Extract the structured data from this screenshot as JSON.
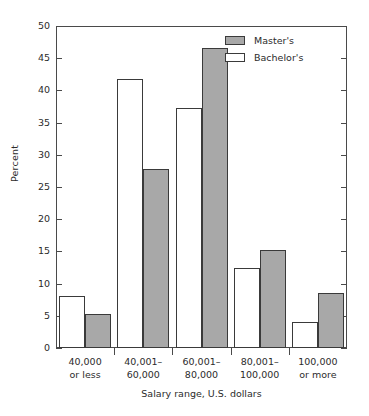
{
  "chart_data": {
    "type": "bar",
    "title": "",
    "xlabel": "Salary range, U.S. dollars",
    "ylabel": "Percent",
    "ylim": [
      0,
      50
    ],
    "ytick_step": 5,
    "yticks": [
      0,
      5,
      10,
      15,
      20,
      25,
      30,
      35,
      40,
      45,
      50
    ],
    "ytick_labels": [
      "0",
      "5",
      "10",
      "15",
      "20",
      "25",
      "30",
      "35",
      "40",
      "45",
      "50"
    ],
    "grid": false,
    "legend_position": "top-right",
    "categories": [
      "40,000 or less",
      "40,001–60,000",
      "60,001–80,000",
      "80,001–100,000",
      "100,000 or more"
    ],
    "category_lines": [
      [
        "40,000",
        "or less"
      ],
      [
        "40,001–",
        "60,000"
      ],
      [
        "60,001–",
        "80,000"
      ],
      [
        "80,001–",
        "100,000"
      ],
      [
        "100,000",
        "or more"
      ]
    ],
    "series": [
      {
        "name": "Bachelor's",
        "fill": "#ffffff",
        "values": [
          8.0,
          41.8,
          37.2,
          12.5,
          4.0
        ]
      },
      {
        "name": "Master's",
        "fill": "#a8a8a8",
        "values": [
          5.3,
          27.8,
          46.6,
          15.2,
          8.6
        ]
      }
    ]
  },
  "legend": {
    "items": [
      {
        "label": "Master's",
        "swatch": "masters"
      },
      {
        "label": "Bachelor's",
        "swatch": "bachelors"
      }
    ]
  },
  "colors": {
    "masters_fill": "#a8a8a8",
    "bachelors_fill": "#ffffff",
    "bar_outline": "#3a3a3a",
    "axis": "#4a4a4a",
    "text": "#2b2b2b",
    "background": "#ffffff"
  }
}
